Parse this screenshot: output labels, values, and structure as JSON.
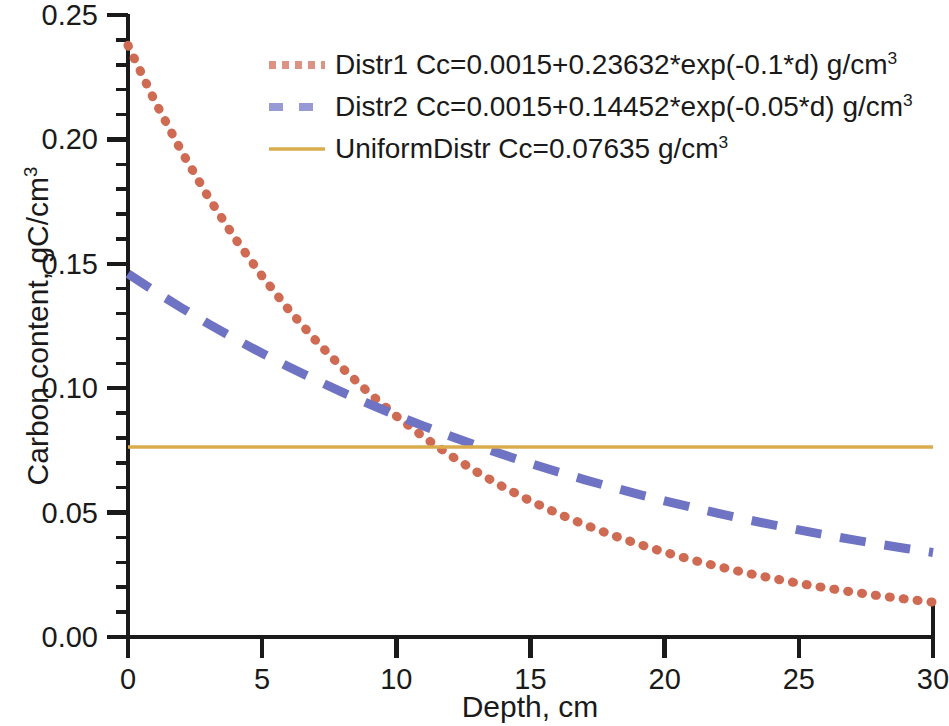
{
  "chart_data": {
    "type": "line",
    "title": "",
    "xlabel": "Depth, cm",
    "ylabel_text": "Carbon content, gC/cm",
    "ylabel_sup": "3",
    "xlabel_plain": "Depth, cm",
    "xlim": [
      0,
      30
    ],
    "ylim": [
      0.0,
      0.25
    ],
    "xticks": [
      "0",
      "5",
      "10",
      "15",
      "20",
      "25",
      "30"
    ],
    "xtick_values": [
      0,
      5,
      10,
      15,
      20,
      25,
      30
    ],
    "yticks": [
      "0.00",
      "0.05",
      "0.10",
      "0.15",
      "0.20",
      "0.25"
    ],
    "ytick_values": [
      0.0,
      0.05,
      0.1,
      0.15,
      0.2,
      0.25
    ],
    "y_minor_step": 0.01,
    "grid": false,
    "legend_position": "upper-right-inside",
    "x": [
      0,
      1,
      2,
      3,
      4,
      5,
      6,
      7,
      8,
      9,
      10,
      11,
      12,
      13,
      14,
      15,
      16,
      17,
      18,
      19,
      20,
      21,
      22,
      23,
      24,
      25,
      26,
      27,
      28,
      29,
      30
    ],
    "series": [
      {
        "name": "Distr1",
        "label": "Distr1 Cc=0.0015+0.23632*exp(-0.1*d) g/cm",
        "label_sup": "3",
        "formula": "Cc=0.0015+0.23632*exp(-0.1*d)",
        "units": "g/cm3",
        "style": "dotted",
        "color": "#cf6a53",
        "a": 0.0015,
        "b": 0.23632,
        "k": -0.1,
        "values": [
          0.23782,
          0.21536,
          0.19505,
          0.17667,
          0.16004,
          0.14501,
          0.1314,
          0.1191,
          0.10797,
          0.09789,
          0.08878,
          0.08053,
          0.07307,
          0.06632,
          0.06022,
          0.0547,
          0.04971,
          0.0452,
          0.04112,
          0.03742,
          0.03408,
          0.03105,
          0.02832,
          0.02584,
          0.0236,
          0.02157,
          0.01974,
          0.01808,
          0.01658,
          0.01522,
          0.014
        ]
      },
      {
        "name": "Distr2",
        "label": "Distr2 Cc=0.0015+0.14452*exp(-0.05*d) g/cm",
        "label_sup": "3",
        "formula": "Cc=0.0015+0.14452*exp(-0.05*d)",
        "units": "g/cm3",
        "style": "dashed",
        "color": "#6f73c4",
        "a": 0.0015,
        "b": 0.14452,
        "k": -0.05,
        "values": [
          0.14602,
          0.13896,
          0.13225,
          0.12586,
          0.11979,
          0.11401,
          0.10852,
          0.10329,
          0.09833,
          0.0936,
          0.08911,
          0.08484,
          0.08078,
          0.07692,
          0.07325,
          0.06976,
          0.06644,
          0.06328,
          0.06028,
          0.05743,
          0.05472,
          0.05214,
          0.04969,
          0.04736,
          0.04514,
          0.04303,
          0.04103,
          0.03912,
          0.03731,
          0.03559,
          0.03395
        ]
      },
      {
        "name": "UniformDistr",
        "label": "UniformDistr Cc=0.07635 g/cm",
        "label_sup": "3",
        "formula": "Cc=0.07635",
        "units": "g/cm3",
        "style": "solid",
        "color": "#d9ad4e",
        "constant": 0.07635,
        "values": [
          0.07635,
          0.07635,
          0.07635,
          0.07635,
          0.07635,
          0.07635,
          0.07635,
          0.07635,
          0.07635,
          0.07635,
          0.07635,
          0.07635,
          0.07635,
          0.07635,
          0.07635,
          0.07635,
          0.07635,
          0.07635,
          0.07635,
          0.07635,
          0.07635,
          0.07635,
          0.07635,
          0.07635,
          0.07635,
          0.07635,
          0.07635,
          0.07635,
          0.07635,
          0.07635,
          0.07635
        ]
      }
    ],
    "axis_color": "#1a1a1a"
  }
}
